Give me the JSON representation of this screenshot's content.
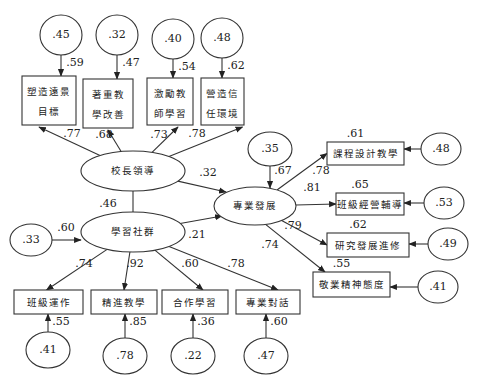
{
  "latent": {
    "leadership": {
      "label": "校長領導",
      "cx": 133,
      "cy": 171,
      "rx": 52,
      "ry": 20
    },
    "community": {
      "label": "學習社群",
      "cx": 133,
      "cy": 232,
      "rx": 52,
      "ry": 20
    },
    "profdev": {
      "label": "專業發展",
      "cx": 255,
      "cy": 206,
      "rx": 41,
      "ry": 19
    }
  },
  "structural_paths": [
    {
      "from": "leadership",
      "to": "community",
      "type": "correlation",
      "coef": ".46",
      "label_x": 108,
      "label_y": 204
    },
    {
      "from": "leadership",
      "to": "profdev",
      "type": "regression",
      "coef": ".32",
      "label_x": 208,
      "label_y": 173
    },
    {
      "from": "community",
      "to": "profdev",
      "type": "regression",
      "coef": ".21",
      "label_x": 197,
      "label_y": 235
    }
  ],
  "residual_community": {
    "value": ".33",
    "cx": 31,
    "cy": 240,
    "path_coef": ".60"
  },
  "residual_profdev": {
    "value": ".35",
    "cx": 270,
    "cy": 149,
    "path_coef": ".67"
  },
  "leadership_indicators": [
    {
      "lines": [
        "塑造遠景",
        "目標"
      ],
      "x": 22,
      "y": 76,
      "w": 54,
      "h": 49,
      "loading": ".77",
      "error": ".45",
      "ecx": 61,
      "ecy": 35,
      "error_path": ".59"
    },
    {
      "lines": [
        "著重教",
        "學改善"
      ],
      "x": 83,
      "y": 79,
      "w": 50,
      "h": 49,
      "loading": ".68",
      "error": ".32",
      "ecx": 117,
      "ecy": 35,
      "error_path": ".47"
    },
    {
      "lines": [
        "激勵教",
        "師學習"
      ],
      "x": 147,
      "y": 78,
      "w": 46,
      "h": 47,
      "loading": ".73",
      "error": ".40",
      "ecx": 173,
      "ecy": 39,
      "error_path": ".54"
    },
    {
      "lines": [
        "營造信",
        "任環境"
      ],
      "x": 201,
      "y": 78,
      "w": 43,
      "h": 47,
      "loading": ".78",
      "error": ".48",
      "ecx": 222,
      "ecy": 38,
      "error_path": ".62"
    }
  ],
  "community_indicators": [
    {
      "label": "班級運作",
      "x": 14,
      "y": 290,
      "w": 69,
      "h": 24,
      "loading": ".74",
      "error": ".41",
      "ecx": 48,
      "ecy": 350,
      "error_path": ".55"
    },
    {
      "label": "精進教學",
      "x": 91,
      "y": 290,
      "w": 66,
      "h": 24,
      "loading": ".92",
      "error": ".78",
      "ecx": 125,
      "ecy": 356,
      "error_path": ".85"
    },
    {
      "label": "合作學習",
      "x": 162,
      "y": 290,
      "w": 66,
      "h": 24,
      "loading": ".60",
      "error": ".22",
      "ecx": 193,
      "ecy": 356,
      "error_path": ".36"
    },
    {
      "label": "專業對話",
      "x": 236,
      "y": 290,
      "w": 64,
      "h": 24,
      "loading": ".78",
      "error": ".47",
      "ecx": 266,
      "ecy": 356,
      "error_path": ".60"
    }
  ],
  "profdev_indicators": [
    {
      "label": "課程設計教學",
      "x": 327,
      "y": 142,
      "w": 77,
      "h": 23,
      "loading": ".78",
      "r2": ".61",
      "error": ".48",
      "ecx": 441,
      "ecy": 149
    },
    {
      "label": "班級經營輔導",
      "x": 336,
      "y": 193,
      "w": 68,
      "h": 22,
      "loading": ".81",
      "r2": ".65",
      "error": ".53",
      "ecx": 444,
      "ecy": 203
    },
    {
      "label": "研究發展進修",
      "x": 327,
      "y": 233,
      "w": 82,
      "h": 24,
      "loading": ".79",
      "r2": ".62",
      "error": ".49",
      "ecx": 448,
      "ecy": 244
    },
    {
      "label": "敬業精神態度",
      "x": 313,
      "y": 272,
      "w": 77,
      "h": 25,
      "loading": ".74",
      "r2": ".55",
      "error": ".41",
      "ecx": 438,
      "ecy": 287
    }
  ],
  "colors": {
    "stroke": "#333333",
    "text": "#222222",
    "background": "#ffffff"
  }
}
